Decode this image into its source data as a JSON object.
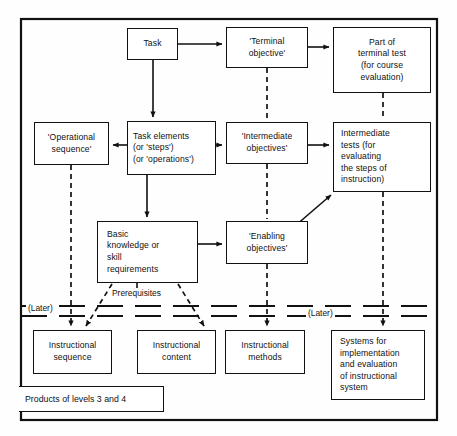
{
  "diagram": {
    "frame": {
      "label": "outer-frame"
    },
    "nodes": [
      {
        "id": "task",
        "text": "Task"
      },
      {
        "id": "terminal-objective",
        "text": "'Terminal\nobjective'"
      },
      {
        "id": "part-terminal-test",
        "text": "Part of\nterminal test\n(for course\nevaluation)"
      },
      {
        "id": "operational-sequence",
        "text": "'Operational\nsequence'"
      },
      {
        "id": "task-elements",
        "text": "Task elements\n(or 'steps')\n(or 'operations')"
      },
      {
        "id": "intermediate-objectives",
        "text": "'Intermediate\nobjectives'"
      },
      {
        "id": "intermediate-tests",
        "text": "Intermediate\ntests (for\nevaluating\nthe steps of\ninstruction)"
      },
      {
        "id": "basic-knowledge",
        "text": "Basic\nknowledge or\nskill\nrequirements"
      },
      {
        "id": "enabling-objectives",
        "text": "'Enabling\nobjectives'"
      },
      {
        "id": "instructional-sequence",
        "text": "Instructional\nsequence"
      },
      {
        "id": "instructional-content",
        "text": "Instructional\ncontent"
      },
      {
        "id": "instructional-methods",
        "text": "Instructional\nmethods"
      },
      {
        "id": "systems-implementation",
        "text": "Systems for\nimplementation\nand evaluation\nof instructional\nsystem"
      }
    ],
    "labels": {
      "prerequisites": "Prerequisites",
      "later_left": "(Later)",
      "later_right": "(Later)",
      "products": "Products of levels 3 and 4"
    },
    "colors": {
      "line": "#111111",
      "background": "#ffffff",
      "text": "#111111"
    }
  }
}
